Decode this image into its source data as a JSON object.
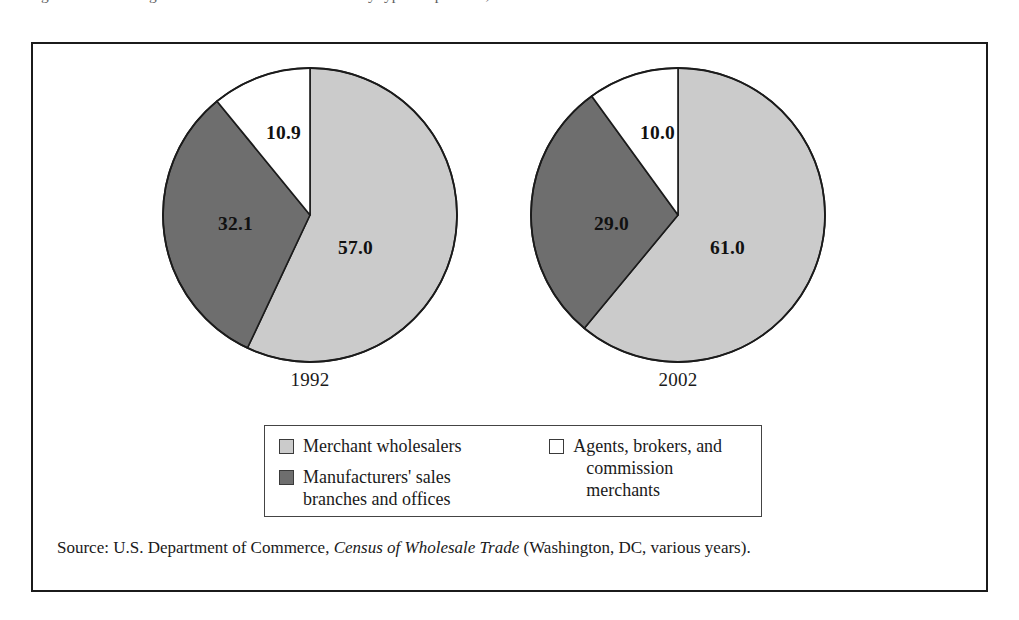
{
  "caption": {
    "text": "Figure 1.1   Percentage distribution of wholesale trade by type of operation, 1992 and 2002"
  },
  "chart_data": {
    "type": "pie",
    "title": "",
    "units": "percent",
    "legend_position": "bottom",
    "categories": [
      "Merchant wholesalers",
      "Manufacturers' sales branches and offices",
      "Agents, brokers, and commission merchants"
    ],
    "charts": [
      {
        "name": "1992",
        "label": "1992",
        "slices": [
          {
            "category": "Merchant wholesalers",
            "value": 57.0,
            "display": "57.0",
            "color": "#cbcbcb"
          },
          {
            "category": "Manufacturers' sales branches and offices",
            "value": 32.1,
            "display": "32.1",
            "color": "#6e6e6e"
          },
          {
            "category": "Agents, brokers, and commission merchants",
            "value": 10.9,
            "display": "10.9",
            "color": "#ffffff"
          }
        ]
      },
      {
        "name": "2002",
        "label": "2002",
        "slices": [
          {
            "category": "Merchant wholesalers",
            "value": 61.0,
            "display": "61.0",
            "color": "#cbcbcb"
          },
          {
            "category": "Manufacturers' sales branches and offices",
            "value": 29.0,
            "display": "29.0",
            "color": "#6e6e6e"
          },
          {
            "category": "Agents, brokers, and commission merchants",
            "value": 10.0,
            "display": "10.0",
            "color": "#ffffff"
          }
        ]
      }
    ]
  },
  "legend": {
    "entries": [
      {
        "key": "merchant",
        "swatch": "light",
        "line1": "Merchant wholesalers",
        "line2": ""
      },
      {
        "key": "branches",
        "swatch": "dark",
        "line1": "Manufacturers' sales",
        "line2": "branches and offices"
      },
      {
        "key": "agents",
        "swatch": "white",
        "line1": "Agents, brokers, and",
        "line2": "commission merchants"
      }
    ]
  },
  "source": {
    "prefix": "Source: U.S. Department of Commerce, ",
    "italic_title": "Census of Wholesale Trade",
    "suffix": " (Washington, DC, various years)."
  },
  "colors": {
    "light_gray": "#cbcbcb",
    "dark_gray": "#6e6e6e",
    "white": "#ffffff",
    "outline": "#1b1b1b"
  }
}
